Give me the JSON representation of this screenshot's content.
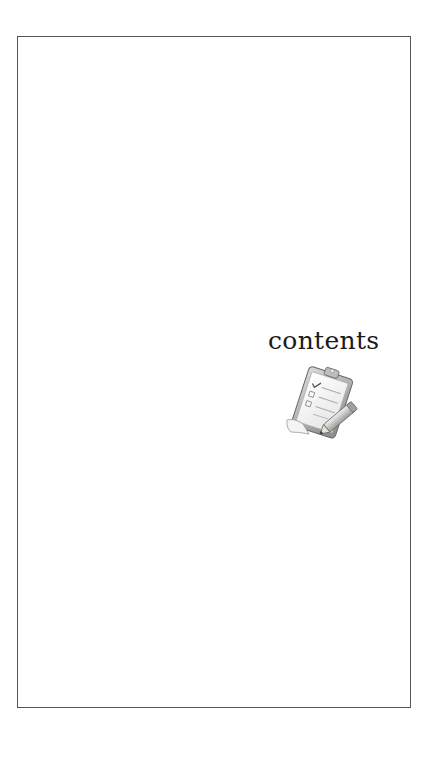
{
  "page": {
    "section_title": "contents",
    "icon": "clipboard-checklist-pencil-icon",
    "border_color": "#555555",
    "background_color": "#ffffff"
  }
}
